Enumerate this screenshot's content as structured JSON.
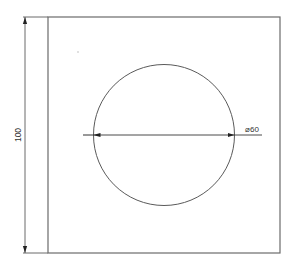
{
  "drawing": {
    "width": 297,
    "height": 272,
    "stroke_color": "#6b6b6b",
    "arrow_color": "#222222",
    "square": {
      "x": 48,
      "y": 17,
      "width": 232,
      "height": 236
    },
    "circle": {
      "cx": 164,
      "cy": 135,
      "r": 70.5
    },
    "stray_dot": {
      "cx": 78,
      "cy": 52
    }
  },
  "dimensions": {
    "height": {
      "label": "100",
      "line_x": 25,
      "y1": 17,
      "y2": 253
    },
    "diameter": {
      "label": "⌀60",
      "line_y": 135,
      "x1": 83,
      "x2": 262
    }
  }
}
